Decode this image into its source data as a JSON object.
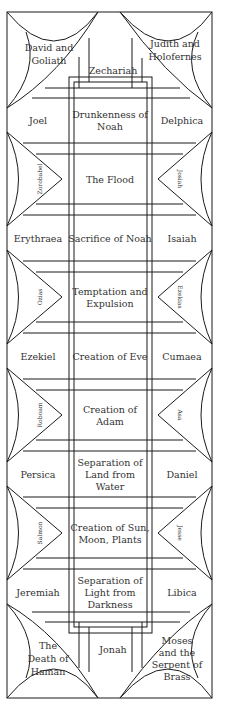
{
  "diagram": {
    "colors": {
      "line": "#1a1a1a",
      "text": "#333333",
      "background": "#ffffff"
    },
    "corner_pendentives": {
      "top_left": [
        "David and",
        "Goliath"
      ],
      "top_right": [
        "Judith and",
        "Holofernes"
      ],
      "bottom_left": [
        "The",
        "Death of",
        "Haman"
      ],
      "bottom_right": [
        "Moses",
        "and the",
        "Serpent of",
        "Brass"
      ]
    },
    "prophets_ends": {
      "top": "Zechariah",
      "bottom": "Jonah"
    },
    "rows": [
      {
        "left": "Joel",
        "center": [
          "Drunkenness of",
          "Noah"
        ],
        "right": "Delphica"
      },
      {
        "left_lunette": "Zorobabel",
        "center": [
          "The Flood"
        ],
        "right_lunette": "Josiah"
      },
      {
        "left": "Erythraea",
        "center": [
          "Sacrifice of Noah"
        ],
        "right": "Isaiah"
      },
      {
        "left_lunette": "Ozias",
        "center": [
          "Temptation and",
          "Expulsion"
        ],
        "right_lunette": "Ezekias"
      },
      {
        "left": "Ezekiel",
        "center": [
          "Creation of Eve"
        ],
        "right": "Cumaea"
      },
      {
        "left_lunette": "Roboam",
        "center": [
          "Creation of",
          "Adam"
        ],
        "right_lunette": "Asa"
      },
      {
        "left": "Persica",
        "center": [
          "Separation of",
          "Land from",
          "Water"
        ],
        "right": "Daniel"
      },
      {
        "left_lunette": "Salmon",
        "center": [
          "Creation of Sun,",
          "Moon, Plants"
        ],
        "right_lunette": "Jesse"
      },
      {
        "left": "Jeremiah",
        "center": [
          "Separation of",
          "Light from",
          "Darkness"
        ],
        "right": "Libica"
      }
    ]
  }
}
